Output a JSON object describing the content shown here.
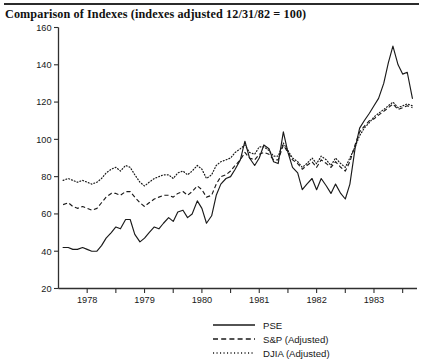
{
  "page": {
    "title": "Comparison of Indexes (indexes adjusted 12/31/82 = 100)",
    "top_rule": "horizontal-rule"
  },
  "legend": {
    "position": "bottom-center",
    "items": [
      {
        "label": "PSE",
        "style": "solid",
        "icon": "solid-line-swatch"
      },
      {
        "label": "S&P (Adjusted)",
        "style": "dashed",
        "icon": "dashed-line-swatch"
      },
      {
        "label": "DJIA (Adjusted)",
        "style": "dotted",
        "icon": "dotted-line-swatch"
      }
    ]
  },
  "chart_data": {
    "type": "line",
    "title": "Comparison of Indexes (indexes adjusted 12/31/82 = 100)",
    "xlabel": "",
    "ylabel": "",
    "ylim": [
      20,
      160
    ],
    "yticks": [
      20,
      40,
      60,
      80,
      100,
      120,
      140,
      160
    ],
    "xlim": [
      1977.5,
      1983.75
    ],
    "xticks": [
      1978,
      1979,
      1980,
      1981,
      1982,
      1983
    ],
    "xtick_labels": [
      "1978",
      "1979",
      "1980",
      "1981",
      "1982",
      "1983"
    ],
    "minor_xticks": [
      1978.5,
      1979.5,
      1980.5,
      1981.5,
      1982.5,
      1983.5
    ],
    "grid": false,
    "legend_position": "bottom-center",
    "x": [
      1977.58,
      1977.67,
      1977.75,
      1977.83,
      1977.92,
      1978.0,
      1978.08,
      1978.17,
      1978.25,
      1978.33,
      1978.42,
      1978.5,
      1978.58,
      1978.67,
      1978.75,
      1978.83,
      1978.92,
      1979.0,
      1979.08,
      1979.17,
      1979.25,
      1979.33,
      1979.42,
      1979.5,
      1979.58,
      1979.67,
      1979.75,
      1979.83,
      1979.92,
      1980.0,
      1980.08,
      1980.17,
      1980.25,
      1980.33,
      1980.42,
      1980.5,
      1980.58,
      1980.67,
      1980.75,
      1980.83,
      1980.92,
      1981.0,
      1981.08,
      1981.17,
      1981.25,
      1981.33,
      1981.42,
      1981.5,
      1981.58,
      1981.67,
      1981.75,
      1981.83,
      1981.92,
      1982.0,
      1982.08,
      1982.17,
      1982.25,
      1982.33,
      1982.42,
      1982.5,
      1982.58,
      1982.67,
      1982.75,
      1982.83,
      1982.92,
      1983.0,
      1983.08,
      1983.17,
      1983.25,
      1983.33,
      1983.42,
      1983.5,
      1983.58,
      1983.67
    ],
    "series": [
      {
        "name": "PSE",
        "style": "solid",
        "values": [
          42,
          42,
          41,
          41,
          42,
          41,
          40,
          40,
          43,
          47,
          50,
          53,
          52,
          57,
          57,
          49,
          45,
          47,
          50,
          53,
          52,
          55,
          58,
          56,
          61,
          62,
          58,
          60,
          67,
          63,
          55,
          59,
          70,
          76,
          79,
          80,
          84,
          89,
          99,
          90,
          86,
          90,
          97,
          95,
          88,
          87,
          104,
          93,
          85,
          82,
          73,
          76,
          79,
          73,
          79,
          75,
          71,
          76,
          71,
          68,
          76,
          95,
          106,
          110,
          114,
          118,
          122,
          130,
          141,
          150,
          140,
          135,
          136,
          122
        ]
      },
      {
        "name": "S&P (Adjusted)",
        "style": "dashed",
        "values": [
          65,
          66,
          64,
          63,
          64,
          63,
          62,
          63,
          66,
          69,
          71,
          71,
          70,
          72,
          72,
          69,
          66,
          64,
          66,
          68,
          69,
          70,
          70,
          69,
          71,
          72,
          70,
          72,
          75,
          73,
          69,
          70,
          76,
          80,
          81,
          83,
          86,
          89,
          93,
          90,
          89,
          92,
          93,
          92,
          89,
          89,
          97,
          93,
          89,
          87,
          84,
          86,
          88,
          85,
          89,
          87,
          85,
          88,
          85,
          83,
          88,
          97,
          104,
          107,
          110,
          111,
          113,
          115,
          117,
          119,
          116,
          117,
          118,
          117
        ]
      },
      {
        "name": "DJIA (Adjusted)",
        "style": "dotted",
        "values": [
          78,
          79,
          78,
          77,
          78,
          77,
          76,
          77,
          79,
          82,
          84,
          85,
          83,
          86,
          85,
          81,
          77,
          75,
          77,
          79,
          80,
          81,
          81,
          79,
          82,
          83,
          81,
          83,
          86,
          84,
          79,
          81,
          86,
          88,
          89,
          90,
          93,
          95,
          97,
          93,
          92,
          96,
          96,
          94,
          91,
          91,
          98,
          94,
          90,
          88,
          85,
          87,
          90,
          87,
          91,
          89,
          86,
          90,
          87,
          85,
          90,
          96,
          102,
          106,
          109,
          112,
          114,
          116,
          118,
          120,
          117,
          118,
          119,
          118
        ]
      }
    ]
  }
}
